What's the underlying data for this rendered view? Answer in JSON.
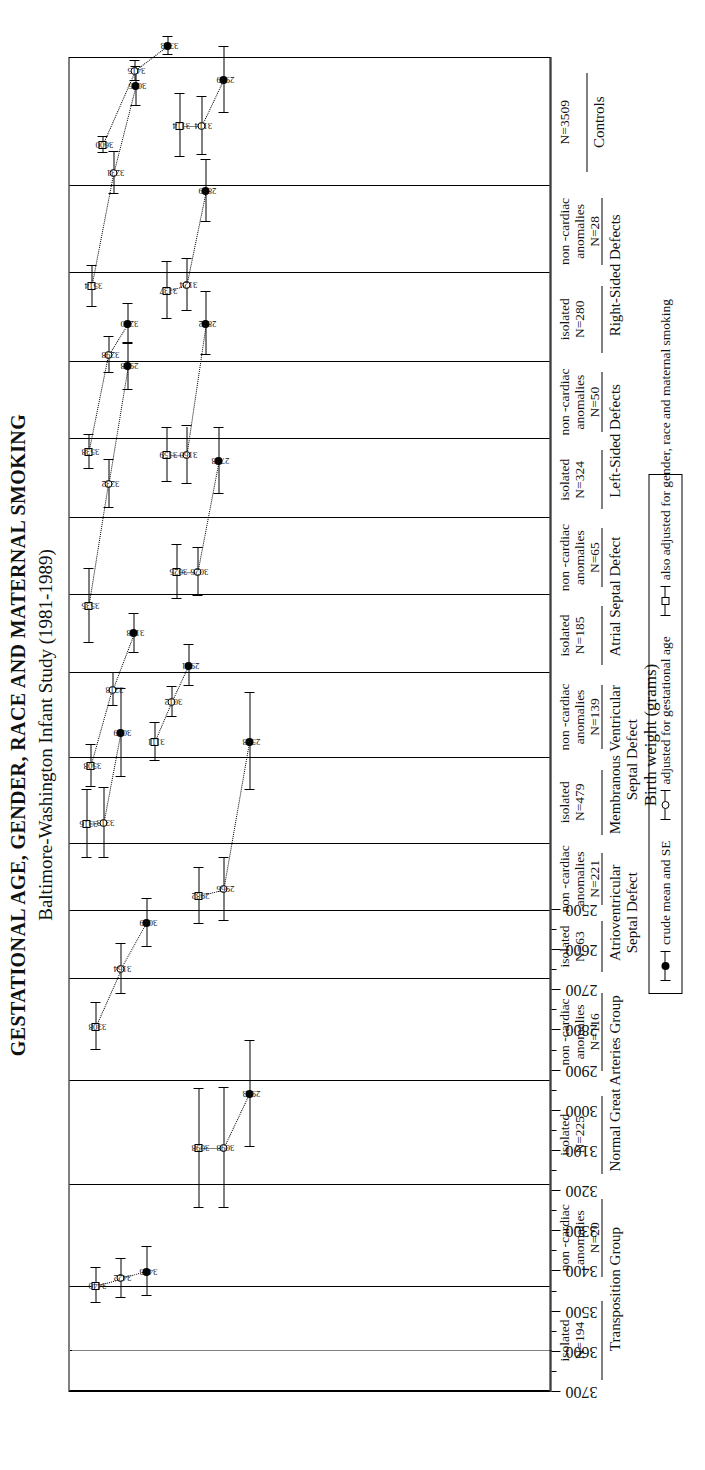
{
  "title": {
    "line1": "GESTATIONAL AGE, GENDER, RACE AND MATERNAL SMOKING",
    "line2": "Baltimore-Washington Infant Study (1981-1989)"
  },
  "axis": {
    "label": "Birth weight (grams)",
    "ticks": [
      "3700",
      "3600",
      "3500",
      "3400",
      "3300",
      "3200",
      "3100",
      "3000",
      "2900",
      "2800",
      "2700",
      "2600",
      "2500"
    ],
    "min": 2500,
    "max": 3700,
    "reference_line": 3600
  },
  "legend": {
    "items": [
      {
        "marker": "filled-circle",
        "label": "crude mean and SE"
      },
      {
        "marker": "open-circle",
        "label": "adjusted for gestational age"
      },
      {
        "marker": "open-square",
        "label": "also adjusted for gender, race and maternal smoking"
      }
    ]
  },
  "labels": {
    "isolated": "isolated",
    "noncardiac": "non -cardiac",
    "anomalies": "anomalies"
  },
  "chart_data": {
    "type": "scatter",
    "title": "GESTATIONAL AGE, GENDER, RACE AND MATERNAL SMOKING",
    "subtitle": "Baltimore-Washington Infant Study (1981-1989)",
    "xlabel": "",
    "ylabel": "Birth weight (grams)",
    "ylim": [
      2500,
      3700
    ],
    "grid": false,
    "legend_position": "bottom",
    "series_names": [
      "crude mean and SE",
      "adjusted for gestational age",
      "also adjusted for gender, race and maternal smoking"
    ],
    "groups": [
      {
        "name": "Transposition Group",
        "subgroups": [
          {
            "type": "isolated",
            "n_label": "N=194",
            "n": 194,
            "crude": 3405,
            "adj_ga": 3422,
            "adj_full": 3440,
            "se": [
              62,
              48,
              44
            ]
          },
          {
            "type": "non-cardiac anomalies",
            "n_label": "N=20",
            "n": 20,
            "crude": 2963,
            "adj_ga": 3098,
            "adj_full": 3098,
            "se": [
              132,
              150,
              148
            ]
          }
        ]
      },
      {
        "name": "Normal Great Arteries Group",
        "subgroups": [
          {
            "type": "isolated",
            "n_label": "N=225",
            "n": 225,
            "crude": 3049,
            "adj_ga": 3164,
            "adj_full": 3308,
            "se": [
              60,
              62,
              58
            ]
          },
          {
            "type": "non-cardiac anomalies",
            "n_label": "N=116",
            "n": 116,
            "crude": 2598,
            "adj_ga": 2966,
            "adj_full": 2982,
            "se": [
              120,
              78,
              70
            ]
          }
        ]
      },
      {
        "name": "Atrioventricular Septal Defect",
        "subgroups": [
          {
            "type": "isolated",
            "n_label": "N=63",
            "n": 63,
            "crude": 3089,
            "adj_ga": 3313,
            "adj_full": 3316,
            "se": [
              110,
              88,
              85
            ]
          },
          {
            "type": "non-cardiac anomalies",
            "n_label": "N=221",
            "n": 221,
            "crude": 2921,
            "adj_ga": 3012,
            "adj_full": 3111,
            "se": [
              52,
              38,
              48
            ]
          }
        ]
      },
      {
        "name": "Membranous Ventricular Septal Defect",
        "subgroups": [
          {
            "type": "isolated",
            "n_label": "N=479",
            "n": 479,
            "crude": 3178,
            "adj_ga": 3318,
            "adj_full": 3508,
            "se": [
              48,
              42,
              52
            ]
          },
          {
            "type": "non-cardiac anomalies",
            "n_label": "N=139",
            "n": 139,
            "crude": 2748,
            "adj_ga": 3026,
            "adj_full": 3025,
            "se": [
              82,
              60,
              68
            ]
          }
        ]
      },
      {
        "name": "Atrial Septal Defect",
        "subgroups": [
          {
            "type": "isolated",
            "n_label": "N=185",
            "n": 185,
            "crude": 2938,
            "adj_ga": 3232,
            "adj_full": 3535,
            "se": [
              58,
              60,
              92
            ]
          },
          {
            "type": "non-cardiac anomalies",
            "n_label": "N=65",
            "n": 65,
            "crude": 2832,
            "adj_ga": 3160,
            "adj_full": 3159,
            "se": [
              78,
              72,
              68
            ]
          }
        ]
      },
      {
        "name": "Left-Sided Defects",
        "subgroups": [
          {
            "type": "isolated",
            "n_label": "N=324",
            "n": 324,
            "crude": 3220,
            "adj_ga": 3298,
            "adj_full": 3538,
            "se": [
              50,
              45,
              42
            ]
          },
          {
            "type": "non-cardiac anomalies",
            "n_label": "N=50",
            "n": 50,
            "crude": 2889,
            "adj_ga": 3124,
            "adj_full": 3137,
            "se": [
              78,
              65,
              70
            ]
          }
        ]
      },
      {
        "name": "Right-Sided Defects",
        "subgroups": [
          {
            "type": "isolated",
            "n_label": "N=280",
            "n": 280,
            "crude": 3016,
            "adj_ga": 3231,
            "adj_full": 3514,
            "se": [
              48,
              52,
              50
            ]
          },
          {
            "type": "non-cardiac anomalies",
            "n_label": "N=28",
            "n": 28,
            "crude": 2999,
            "adj_ga": 3114,
            "adj_full": 3114,
            "se": [
              82,
              72,
              78
            ]
          }
        ]
      },
      {
        "name": "Controls",
        "subgroups": [
          {
            "type": "combined",
            "n_label": "N=3509",
            "n": 3509,
            "crude": 3353,
            "adj_ga": 3415,
            "adj_full": 3600,
            "se": [
              22,
              24,
              20
            ]
          }
        ]
      }
    ]
  }
}
